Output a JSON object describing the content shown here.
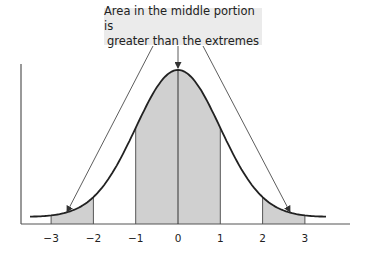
{
  "annotation": {
    "line1": "Area in the middle portion is",
    "line2": "greater than the extremes"
  },
  "chart_data": {
    "type": "area",
    "title": "",
    "xlabel": "",
    "ylabel": "",
    "distribution": "standard normal",
    "x_ticks": [
      -3,
      -2,
      -1,
      0,
      1,
      2,
      3
    ],
    "tick_labels": [
      "−3",
      "−2",
      "−1",
      "0",
      "1",
      "2",
      "3"
    ],
    "xlim": [
      -3.5,
      3.5
    ],
    "shaded_regions": [
      {
        "from": -3,
        "to": -2,
        "name": "left extreme"
      },
      {
        "from": -1,
        "to": 1,
        "name": "middle portion"
      },
      {
        "from": 2,
        "to": 3,
        "name": "right extreme"
      }
    ],
    "annotation": "Area in the middle portion is greater than the extremes",
    "grid": false,
    "colors": {
      "shade": "#d0d0d0",
      "curve": "#222222",
      "axis": "#555555",
      "label_bg": "#ebebeb"
    }
  }
}
